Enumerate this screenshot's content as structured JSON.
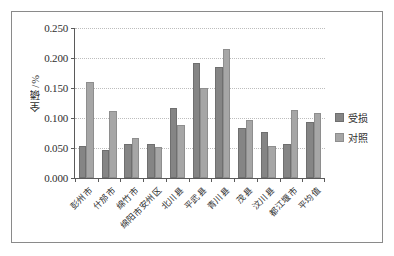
{
  "chart_data": {
    "type": "bar",
    "title": "",
    "xlabel": "",
    "ylabel": "全磷/%",
    "ylim": [
      0,
      0.25
    ],
    "ytick_labels": [
      "0.250",
      "0.200",
      "0.150",
      "0.100",
      "0.050",
      "0.000"
    ],
    "ytick_values": [
      0.25,
      0.2,
      0.15,
      0.1,
      0.05,
      0.0
    ],
    "grid": true,
    "legend_position": "right",
    "categories": [
      "彭州市",
      "什邡市",
      "绵竹市",
      "绵阳市安州区",
      "北川县",
      "平武县",
      "青川县",
      "茂县",
      "汶川县",
      "都江堰市",
      "平均值"
    ],
    "series": [
      {
        "name": "受损",
        "color": "#858585",
        "values": [
          0.053,
          0.047,
          0.056,
          0.057,
          0.117,
          0.192,
          0.185,
          0.084,
          0.077,
          0.056,
          0.093
        ]
      },
      {
        "name": "对照",
        "color": "#a6a6a6",
        "values": [
          0.16,
          0.111,
          0.067,
          0.052,
          0.088,
          0.15,
          0.215,
          0.097,
          0.054,
          0.114,
          0.108
        ]
      }
    ]
  }
}
